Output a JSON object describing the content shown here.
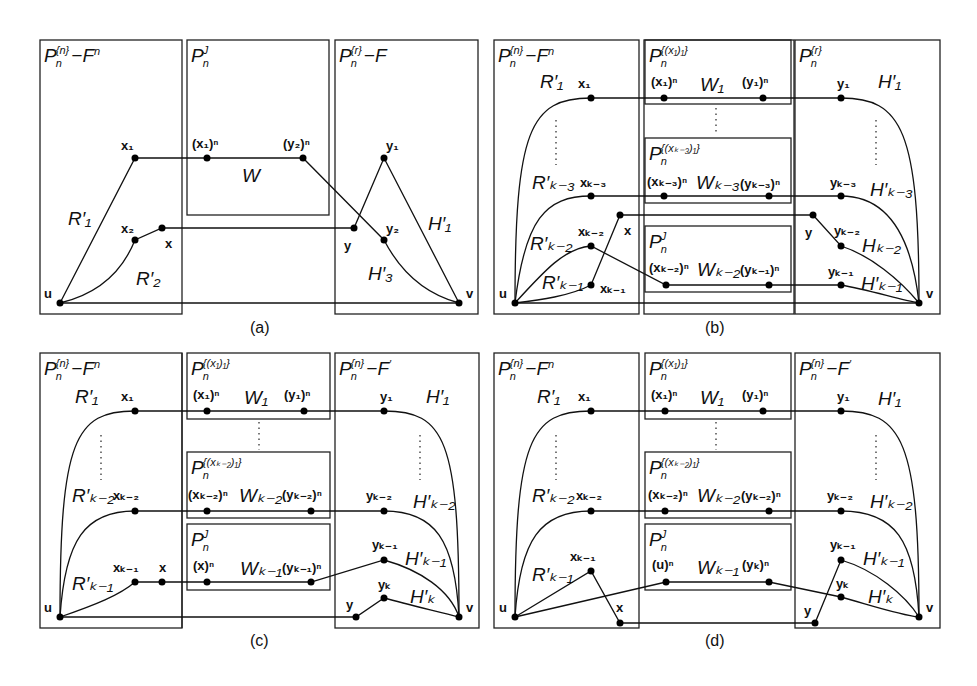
{
  "figure": {
    "panels": [
      {
        "id": "a",
        "caption": "(a)",
        "boxes": [
          {
            "label_base": "P",
            "label_sub": "n",
            "label_sup": "{n}",
            "label_rest": "−F",
            "label_rest_sup": "n"
          },
          {
            "label_base": "P",
            "label_sub": "n",
            "label_sup": "J",
            "label_rest": "",
            "label_rest_sup": ""
          },
          {
            "label_base": "P",
            "label_sub": "n",
            "label_sup": "{r}",
            "label_rest": "−F",
            "label_rest_sup": ""
          }
        ],
        "vertices": {
          "u": "u",
          "v": "v",
          "x1": "x",
          "x1_sub": "1",
          "x2": "x",
          "x2_sub": "2",
          "x": "x",
          "y": "y",
          "y1": "y",
          "y1_sub": "1",
          "y2": "y",
          "y2_sub": "2",
          "x1n": "(x",
          "x1n_sub": "1",
          "x1n_tail": ")",
          "x1n_sup": "n",
          "y2n": "(y",
          "y2n_sub": "2",
          "y2n_tail": ")",
          "y2n_sup": "n"
        },
        "paths": {
          "R1": "R",
          "R1_sub": "1",
          "R2": "R",
          "R2_sub": "2",
          "W": "W",
          "H1": "H",
          "H1_sub": "1",
          "H3": "H",
          "H3_sub": "3"
        }
      },
      {
        "id": "b",
        "caption": "(b)",
        "boxes": [
          {
            "label": "P",
            "sub": "n",
            "sup": "{n}",
            "rest": "−F",
            "rest_sup": "n"
          },
          {
            "label": "P",
            "sub": "n",
            "sup": "{(x₁)₁}"
          },
          {
            "label": "P",
            "sub": "n",
            "sup": "{(xₖ₋₃)₁}"
          },
          {
            "label": "P",
            "sub": "n",
            "sup": "J"
          },
          {
            "label": "P",
            "sub": "n",
            "sup": "{r}"
          }
        ],
        "vertices": [
          "u",
          "v",
          "x₁",
          "xₖ₋₃",
          "xₖ₋₂",
          "xₖ₋₁",
          "x",
          "y",
          "y₁",
          "yₖ₋₃",
          "yₖ₋₂",
          "yₖ₋₁",
          "(x₁)ⁿ",
          "(y₁)ⁿ",
          "(xₖ₋₃)ⁿ",
          "(yₖ₋₃)ⁿ",
          "(xₖ₋₂)ⁿ",
          "(yₖ₋₁)ⁿ"
        ],
        "paths": [
          "R′₁",
          "R′ₖ₋₃",
          "R′ₖ₋₂",
          "R′ₖ₋₁",
          "W₁",
          "Wₖ₋₃",
          "Wₖ₋₂",
          "H′₁",
          "H′ₖ₋₃",
          "Hₖ₋₂",
          "H′ₖ₋₁"
        ]
      },
      {
        "id": "c",
        "caption": "(c)",
        "boxes": [
          {
            "label": "P",
            "sub": "n",
            "sup": "{n}",
            "rest": "−F",
            "rest_sup": "n"
          },
          {
            "label": "P",
            "sub": "n",
            "sup": "{(x₁)₁}"
          },
          {
            "label": "P",
            "sub": "n",
            "sup": "{(xₖ₋₂)₁}"
          },
          {
            "label": "P",
            "sub": "n",
            "sup": "J"
          },
          {
            "label": "P",
            "sub": "n",
            "sup": "{n}",
            "rest": "−F",
            "rest_sup": "′"
          }
        ],
        "vertices": [
          "u",
          "v",
          "x₁",
          "xₖ₋₂",
          "xₖ₋₁",
          "x",
          "y",
          "y₁",
          "yₖ₋₂",
          "yₖ₋₁",
          "yₖ",
          "(x₁)ⁿ",
          "(y₁)ⁿ",
          "(xₖ₋₂)ⁿ",
          "(yₖ₋₂)ⁿ",
          "(x)ⁿ",
          "(yₖ₋₁)ⁿ"
        ],
        "paths": [
          "R′₁",
          "R′ₖ₋₂",
          "R′ₖ₋₁",
          "W₁",
          "Wₖ₋₂",
          "Wₖ₋₁",
          "H′₁",
          "H′ₖ₋₂",
          "H′ₖ₋₁",
          "H′ₖ"
        ]
      },
      {
        "id": "d",
        "caption": "(d)",
        "boxes": [
          {
            "label": "P",
            "sub": "n",
            "sup": "{n}",
            "rest": "−F",
            "rest_sup": "n"
          },
          {
            "label": "P",
            "sub": "n",
            "sup": "{(x₁)₁}"
          },
          {
            "label": "P",
            "sub": "n",
            "sup": "{(xₖ₋₂)₁}"
          },
          {
            "label": "P",
            "sub": "n",
            "sup": "J"
          },
          {
            "label": "P",
            "sub": "n",
            "sup": "{n}",
            "rest": "−F",
            "rest_sup": "′"
          }
        ],
        "vertices": [
          "u",
          "v",
          "x₁",
          "xₖ₋₂",
          "xₖ₋₁",
          "x",
          "y",
          "y₁",
          "yₖ₋₂",
          "yₖ₋₁",
          "yₖ",
          "(x₁)ⁿ",
          "(y₁)ⁿ",
          "(xₖ₋₂)ⁿ",
          "(yₖ₋₂)ⁿ",
          "(u)ⁿ",
          "(yₖ)ⁿ"
        ],
        "paths": [
          "R′₁",
          "R′ₖ₋₂",
          "R′ₖ₋₁",
          "W₁",
          "Wₖ₋₂",
          "Wₖ₋₁",
          "H′₁",
          "H′ₖ₋₂",
          "H′ₖ₋₁",
          "H′ₖ"
        ]
      }
    ],
    "text": {
      "P": "P",
      "n": "n",
      "J": "J",
      "sup_n": "{n}",
      "sup_r": "{r}",
      "minusF": "−F",
      "Fprime": "′",
      "sup_x1": "{(x₁)₁}",
      "sup_xk3": "{(xₖ₋₃)₁}",
      "sup_xk2": "{(xₖ₋₂)₁}",
      "u": "u",
      "v": "v",
      "x": "x",
      "y": "y",
      "x1": "x₁",
      "x2": "x₂",
      "xk3": "xₖ₋₃",
      "xk2": "xₖ₋₂",
      "xk1": "xₖ₋₁",
      "y1": "y₁",
      "y2": "y₂",
      "yk3": "yₖ₋₃",
      "yk2": "yₖ₋₂",
      "yk1": "yₖ₋₁",
      "yk": "yₖ",
      "x1n": "(x₁)ⁿ",
      "y1n": "(y₁)ⁿ",
      "y2n": "(y₂)ⁿ",
      "xk3n": "(xₖ₋₃)ⁿ",
      "yk3n": "(yₖ₋₃)ⁿ",
      "xk2n": "(xₖ₋₂)ⁿ",
      "yk2n": "(yₖ₋₂)ⁿ",
      "yk1n": "(yₖ₋₁)ⁿ",
      "xn": "(x)ⁿ",
      "un": "(u)ⁿ",
      "ykn": "(yₖ)ⁿ",
      "W": "W",
      "W1": "W₁",
      "Wk3": "Wₖ₋₃",
      "Wk2": "Wₖ₋₂",
      "Wk1": "Wₖ₋₁",
      "R1": "R′₁",
      "R2": "R′₂",
      "Rk3": "R′ₖ₋₃",
      "Rk2": "R′ₖ₋₂",
      "Rk1": "R′ₖ₋₁",
      "H1": "H′₁",
      "H3": "H′₃",
      "Hk3": "H′ₖ₋₃",
      "Hk2np": "Hₖ₋₂",
      "Hk2": "H′ₖ₋₂",
      "Hk1": "H′ₖ₋₁",
      "Hk": "H′ₖ",
      "cap_a": "(a)",
      "cap_b": "(b)",
      "cap_c": "(c)",
      "cap_d": "(d)"
    }
  }
}
